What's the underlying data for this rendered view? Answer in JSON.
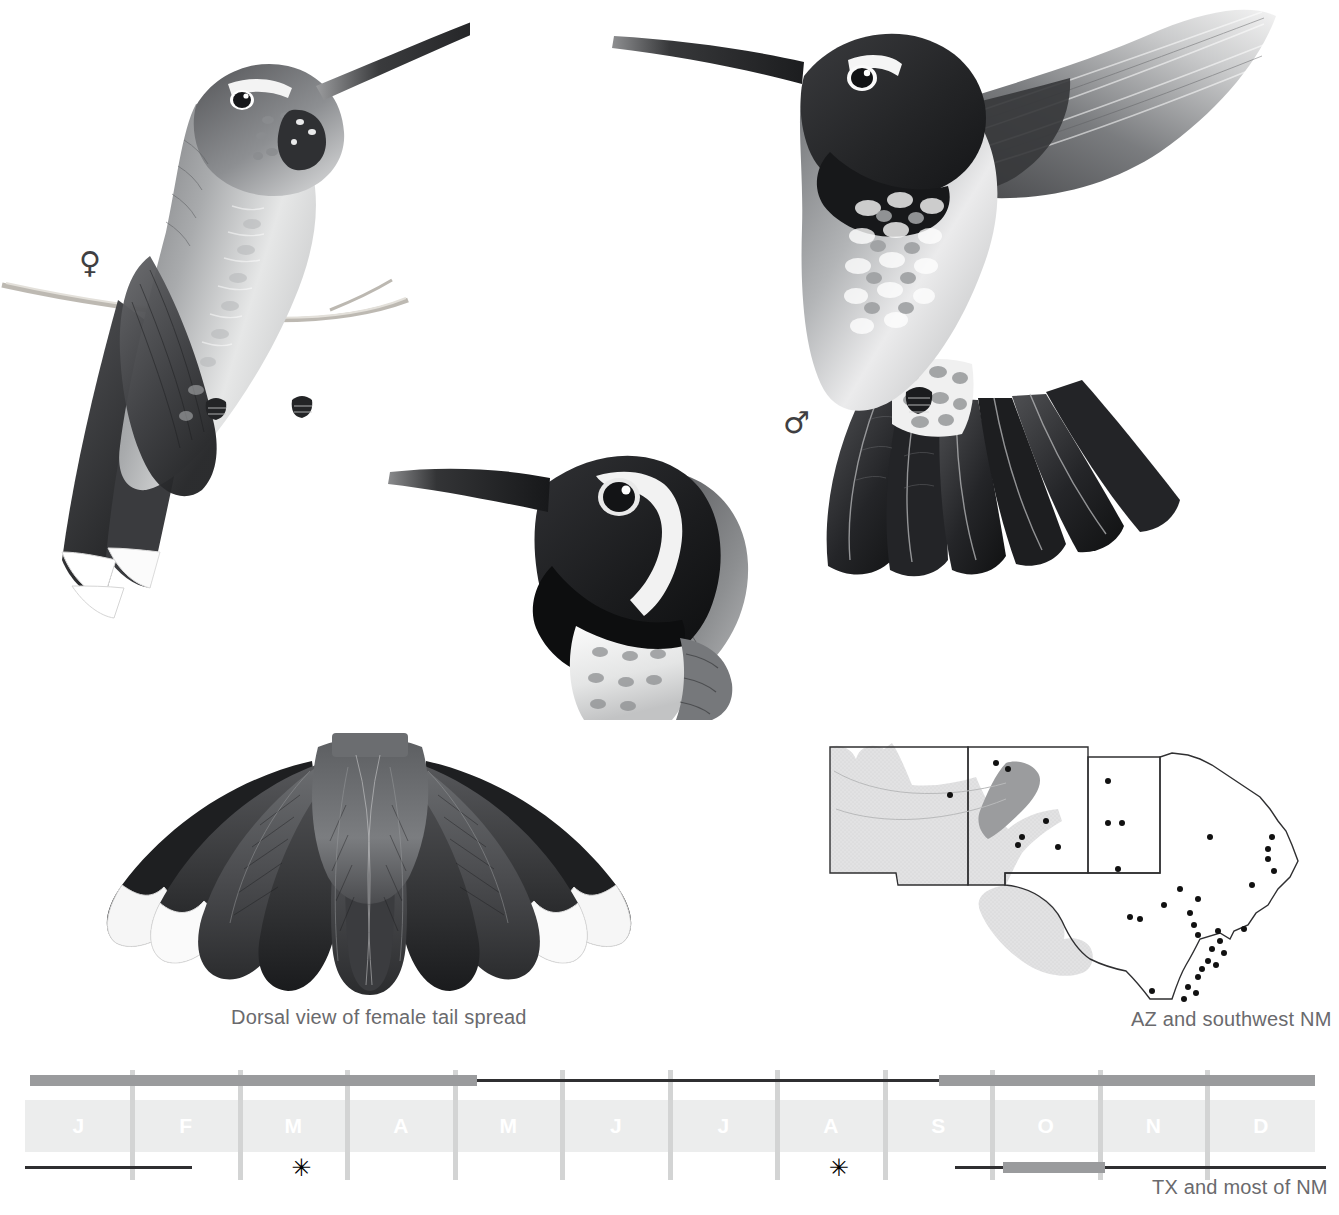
{
  "page": {
    "background": "#ffffff",
    "width": 1339,
    "height": 1215
  },
  "figures": [
    {
      "id": "female-perched",
      "name": "female-hummingbird-perched",
      "sex_symbol": "♀",
      "description": "Female hummingbird perched on a thin twig, grayscale illustration with spotted throat and white-tipped outer tail feathers"
    },
    {
      "id": "male-hovering",
      "name": "male-hummingbird-hovering",
      "sex_symbol": "♂",
      "description": "Male hummingbird hovering with spread wing and fanned dark tail, dark gorget and crown"
    },
    {
      "id": "male-head",
      "name": "male-head-study",
      "description": "Head and upper breast study of male showing blackish gorget, white post-ocular stripe and pale breast"
    },
    {
      "id": "female-tail-spread",
      "name": "female-tail-spread",
      "description": "Dorsal view of a fully spread female tail, ten rectrices with white tips on outer feathers"
    }
  ],
  "captions": {
    "tail_spread": "Dorsal view of female tail spread",
    "map_caption": "AZ and southwest NM",
    "calendar_caption": "TX and most of NM"
  },
  "sex_symbols": {
    "female": "♀",
    "male": "♂"
  },
  "range_map": {
    "name": "range-map",
    "states": [
      "AZ",
      "NM",
      "OK panhandle",
      "TX"
    ],
    "shading": {
      "resident_fill": "#dededf",
      "core_fill": "#9b9c9e",
      "outline": "#3c3c3e"
    },
    "record_dots": 38,
    "dot_color": "#111111"
  },
  "calendar": {
    "name": "phenology-calendar",
    "months": [
      "J",
      "F",
      "M",
      "A",
      "M",
      "J",
      "J",
      "A",
      "S",
      "O",
      "N",
      "D"
    ],
    "band_color": "#eceded",
    "month_label_color": "#ffffff",
    "gridline_color": "#d3d4d4",
    "thick_bar_color": "#9a9b9d",
    "thin_line_color": "#2f2f31",
    "top_row_label": "AZ and southwest NM",
    "bottom_row_label": "TX and most of NM",
    "top_row_segments": [
      {
        "type": "thick",
        "start_month": 0.05,
        "end_month": 4.2
      },
      {
        "type": "thin",
        "start_month": 4.2,
        "end_month": 8.5
      },
      {
        "type": "thick",
        "start_month": 8.5,
        "end_month": 12.0
      }
    ],
    "bottom_row_segments": [
      {
        "type": "thin",
        "start_month": 0.0,
        "end_month": 1.55
      },
      {
        "type": "thin",
        "start_month": 8.65,
        "end_month": 9.1
      },
      {
        "type": "thick",
        "start_month": 9.1,
        "end_month": 10.05
      },
      {
        "type": "thin",
        "start_month": 10.05,
        "end_month": 12.1
      }
    ],
    "bottom_row_stars": [
      2.55,
      7.55
    ],
    "star_glyph": "✳"
  }
}
